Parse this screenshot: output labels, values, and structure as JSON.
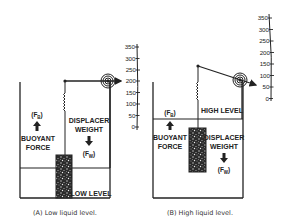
{
  "panels": [
    {
      "id": "A",
      "caption": "(A) Low liquid level.",
      "level_label": "LOW LEVEL",
      "buoyant_symbol": "(F",
      "buoyant_sub": "B",
      "buoyant_label_1": "BUOYANT",
      "buoyant_label_2": "FORCE",
      "weight_label_1": "DISPLACER",
      "weight_label_2": "WEIGHT",
      "weight_symbol": "(F",
      "weight_sub": "W",
      "close_paren": ")",
      "scale_ticks": [
        "350",
        "300",
        "250",
        "200",
        "150",
        "100",
        "50",
        "0"
      ],
      "pointer_reading": "200"
    },
    {
      "id": "B",
      "caption": "(B) High liquid level.",
      "level_label": "HIGH LEVEL",
      "buoyant_symbol": "(F",
      "buoyant_sub": "B",
      "buoyant_label_1": "BUOYANT",
      "buoyant_label_2": "FORCE",
      "weight_label_1": "DISPLACER",
      "weight_label_2": "WEIGHT",
      "weight_symbol": "(F",
      "weight_sub": "W",
      "close_paren": ")",
      "scale_ticks": [
        "350",
        "300",
        "250",
        "200",
        "150",
        "100",
        "50",
        "0"
      ],
      "pointer_reading": "75"
    }
  ],
  "colors": {
    "line": "#222222",
    "background": "#ffffff",
    "displacer_fill": "#3a3a3a"
  }
}
